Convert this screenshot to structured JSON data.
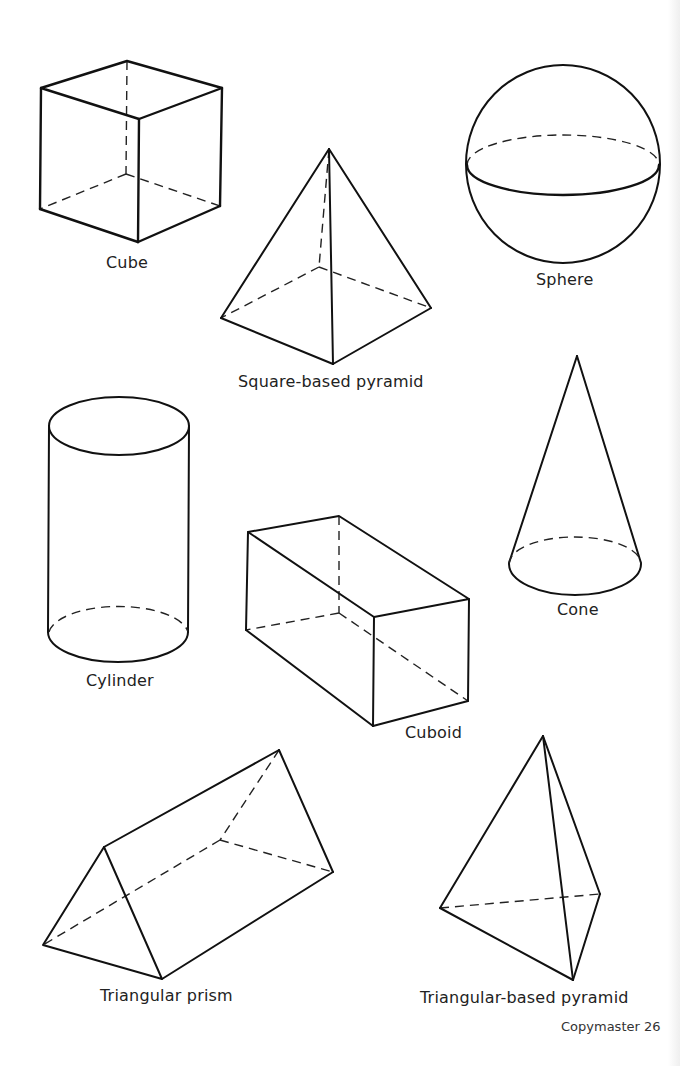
{
  "page": {
    "footer": "Copymaster 26",
    "line_color": "#111111",
    "background": "#ffffff"
  },
  "shapes": [
    {
      "id": "cube",
      "label": "Cube"
    },
    {
      "id": "square-based-pyramid",
      "label": "Square-based pyramid"
    },
    {
      "id": "sphere",
      "label": "Sphere"
    },
    {
      "id": "cylinder",
      "label": "Cylinder"
    },
    {
      "id": "cone",
      "label": "Cone"
    },
    {
      "id": "cuboid",
      "label": "Cuboid"
    },
    {
      "id": "triangular-prism",
      "label": "Triangular prism"
    },
    {
      "id": "triangular-based-pyramid",
      "label": "Triangular-based pyramid"
    }
  ]
}
